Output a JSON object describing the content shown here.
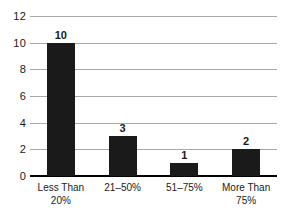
{
  "chart_data": {
    "type": "bar",
    "title": "",
    "subtitle": "",
    "xlabel": "",
    "ylabel": "",
    "categories": [
      "Less Than\n20%",
      "21–50%",
      "51–75%",
      "More Than\n75%"
    ],
    "values": [
      10,
      3,
      1,
      2
    ],
    "value_labels": [
      "10",
      "3",
      "1",
      "2"
    ],
    "ylim": [
      0,
      12
    ],
    "yticks": [
      0,
      2,
      4,
      6,
      8,
      10,
      12
    ],
    "ytick_labels": [
      "0",
      "2",
      "4",
      "6",
      "8",
      "10",
      "12"
    ],
    "grid": true,
    "legend": false,
    "legend_position": "none",
    "bar_color": "#1a1a1a",
    "gridline_color": "#a8a8a8",
    "axis_color": "#000000",
    "background_color": "#ffffff"
  }
}
